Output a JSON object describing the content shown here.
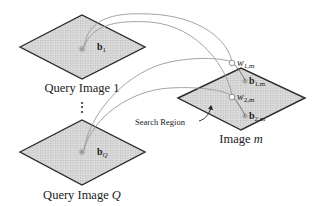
{
  "diagram": {
    "type": "image-retrieval-schematic",
    "query_images": [
      {
        "caption_prefix": "Query Image ",
        "caption_index": "1",
        "vector_base": "b",
        "vector_sub": "1"
      },
      {
        "caption_prefix": "Query Image ",
        "caption_index": "Q",
        "vector_base": "b",
        "vector_sub": "Q"
      }
    ],
    "ellipsis": "⋮",
    "target_image": {
      "caption_prefix": "Image ",
      "caption_index": "m",
      "weights": [
        {
          "base": "w",
          "sub": "1,m"
        },
        {
          "base": "w",
          "sub": "2,m"
        }
      ],
      "matched_vectors": [
        {
          "base": "b",
          "sub": "1,m"
        },
        {
          "base": "b",
          "sub": "2,m"
        }
      ]
    },
    "search_region_label": "Search Region",
    "colors": {
      "plane_fill": "#d4d4d4",
      "plane_stroke": "#2a2a2a",
      "arc_stroke": "#9a9a9a",
      "text": "#222222"
    }
  }
}
